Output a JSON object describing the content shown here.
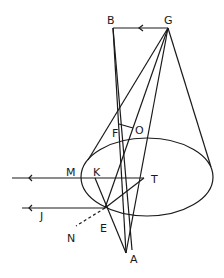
{
  "diagram": {
    "type": "geometric-optics-cone",
    "points": {
      "B": {
        "label": "B",
        "x": 113,
        "y": 28
      },
      "G": {
        "label": "G",
        "x": 168,
        "y": 28
      },
      "F": {
        "label": "F",
        "x": 128,
        "y": 129
      },
      "O": {
        "label": "O",
        "x": 134,
        "y": 131
      },
      "M": {
        "label": "M",
        "x": 81,
        "y": 178
      },
      "K": {
        "label": "K",
        "x": 95,
        "y": 178
      },
      "T": {
        "label": "T",
        "x": 144,
        "y": 178
      },
      "E": {
        "label": "E",
        "x": 105,
        "y": 208
      },
      "J": {
        "label": "J",
        "x": 22,
        "y": 208
      },
      "N": {
        "label": "N",
        "x": 74,
        "y": 226
      },
      "A": {
        "label": "A",
        "x": 126,
        "y": 253
      }
    },
    "labels": [
      {
        "text": "B",
        "x": 107,
        "y": 24
      },
      {
        "text": "G",
        "x": 164,
        "y": 24
      },
      {
        "text": "F",
        "x": 112,
        "y": 137
      },
      {
        "text": "O",
        "x": 135,
        "y": 134
      },
      {
        "text": "M",
        "x": 66,
        "y": 176
      },
      {
        "text": "K",
        "x": 93,
        "y": 176
      },
      {
        "text": "T",
        "x": 151,
        "y": 183
      },
      {
        "text": "J",
        "x": 40,
        "y": 220
      },
      {
        "text": "E",
        "x": 100,
        "y": 232
      },
      {
        "text": "N",
        "x": 67,
        "y": 242
      },
      {
        "text": "A",
        "x": 130,
        "y": 263
      }
    ],
    "ellipse": {
      "cx": 147,
      "cy": 177,
      "rx": 66,
      "ry": 39
    }
  }
}
